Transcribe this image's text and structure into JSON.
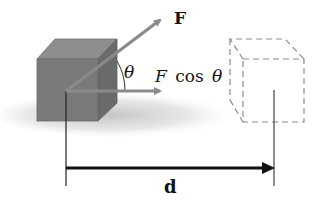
{
  "diagram": {
    "labels": {
      "force": "F",
      "angle": "θ",
      "component_F": "F",
      "component_cos": "cos",
      "component_theta": "θ",
      "displacement": "d"
    },
    "elements": {
      "initial_block": "solid block at initial position",
      "final_block": "dashed block at final position",
      "force_vector": "force F applied at angle θ above horizontal",
      "horizontal_component": "horizontal component F cos θ",
      "displacement_vector": "displacement d"
    },
    "colors": {
      "block_front": "#7a7a7a",
      "block_top": "#8e8e8e",
      "block_side": "#6a6a6a",
      "arrow": "#8a8a8a",
      "dashed": "#8c8c8c",
      "displacement_arrow": "#111111",
      "shadow": "#c8c8c8"
    }
  }
}
